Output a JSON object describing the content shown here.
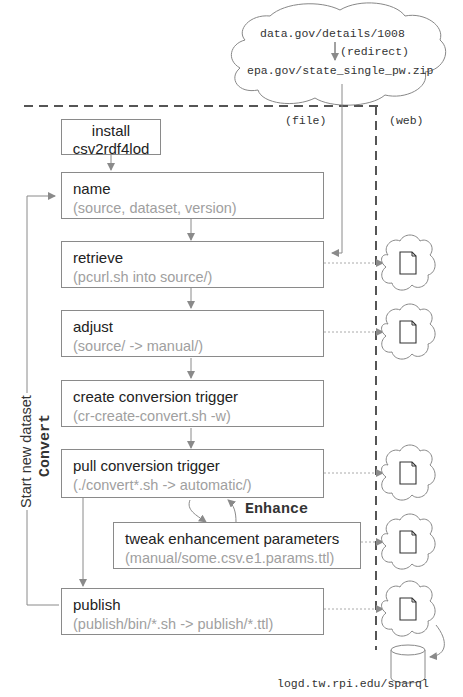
{
  "source_cloud": {
    "line1": "data.gov/details/1008",
    "redirect": "(redirect)",
    "line2": "epa.gov/state_single_pw.zip"
  },
  "regions": {
    "file": "(file)",
    "web": "(web)"
  },
  "install": {
    "line1": "install",
    "line2": "csv2rdf4lod"
  },
  "steps": [
    {
      "title": "name",
      "detail": "(source, dataset, version)"
    },
    {
      "title": "retrieve",
      "detail": "(pcurl.sh into source/)"
    },
    {
      "title": "adjust",
      "detail": "(source/ -> manual/)"
    },
    {
      "title": "create conversion trigger",
      "detail": "(cr-create-convert.sh -w)"
    },
    {
      "title": "pull conversion trigger",
      "detail": "(./convert*.sh -> automatic/)"
    },
    {
      "title": "tweak enhancement parameters",
      "detail": "(manual/some.csv.e1.params.ttl)"
    },
    {
      "title": "publish",
      "detail": "(publish/bin/*.sh -> publish/*.ttl)"
    }
  ],
  "labels": {
    "loop": "Start new dataset",
    "convert": "Convert",
    "enhance": "Enhance",
    "endpoint": "logd.tw.rpi.edu/sparql"
  },
  "colors": {
    "box_border": "#8a8a8a",
    "arrow": "#8a8a8a",
    "title_text": "#222222",
    "detail_text": "#a0a0a0",
    "dashed_border": "#555555"
  }
}
